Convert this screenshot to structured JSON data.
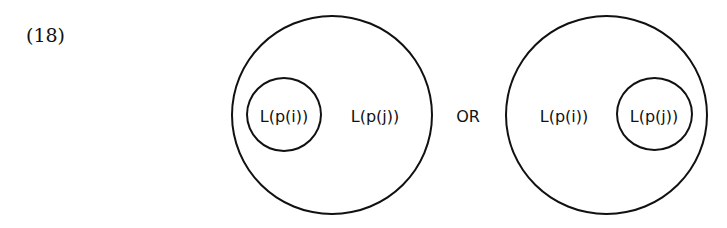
{
  "example_number": "(18)",
  "connector": "OR",
  "left_diagram": {
    "inner_label": "L(p(i))",
    "outer_label": "L(p(j))"
  },
  "right_diagram": {
    "outer_label": "L(p(i))",
    "inner_label": "L(p(j))"
  }
}
